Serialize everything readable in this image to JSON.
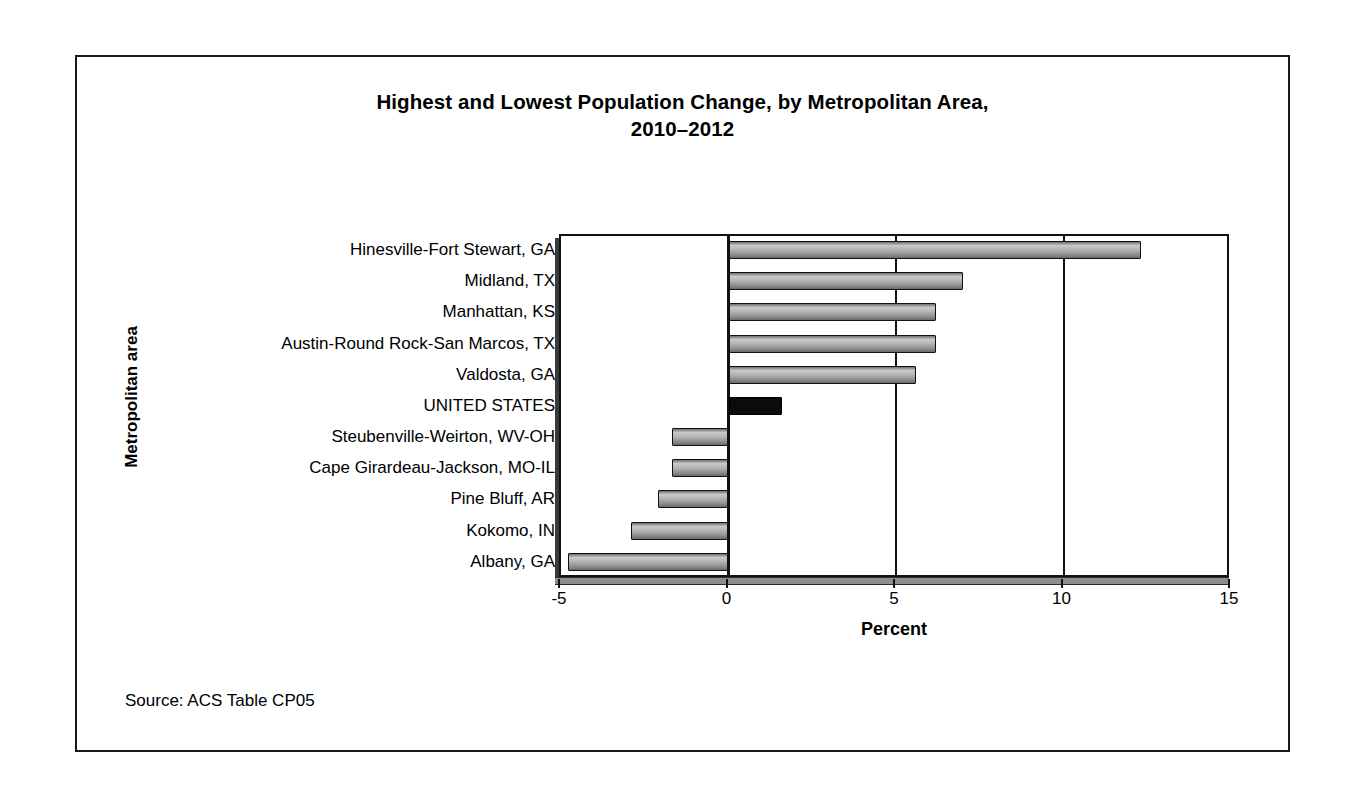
{
  "figure": {
    "title_line1": "Highest and Lowest Population Change, by Metropolitan Area,",
    "title_line2": "2010–2012",
    "source_note": "Source: ACS Table CP05",
    "frame_color": "#1a1a1a",
    "bar_fill_color": "#b4b4b4",
    "bar_border_color": "#111111",
    "highlight_bar_color": "#0b0b0b"
  },
  "chart_data": {
    "type": "bar",
    "orientation": "horizontal",
    "title": "Highest and Lowest Population Change, by Metropolitan Area, 2010–2012",
    "xlabel": "Percent",
    "ylabel": "Metropolitan area",
    "xlim": [
      -5,
      15
    ],
    "xticks": [
      -5,
      0,
      5,
      10,
      15
    ],
    "xtick_labels": [
      "-5",
      "0",
      "5",
      "10",
      "15"
    ],
    "grid": true,
    "legend": "none",
    "categories": [
      "Hinesville-Fort Stewart, GA",
      "Midland, TX",
      "Manhattan, KS",
      "Austin-Round Rock-San Marcos, TX",
      "Valdosta, GA",
      "UNITED STATES",
      "Steubenville-Weirton, WV-OH",
      "Cape Girardeau-Jackson, MO-IL",
      "Pine Bluff, AR",
      "Kokomo, IN",
      "Albany, GA"
    ],
    "values": [
      12.3,
      7.0,
      6.2,
      6.2,
      5.6,
      1.6,
      -1.7,
      -1.7,
      -2.1,
      -2.9,
      -4.8
    ],
    "highlight_index": 5,
    "highlight_label": "UNITED STATES"
  }
}
